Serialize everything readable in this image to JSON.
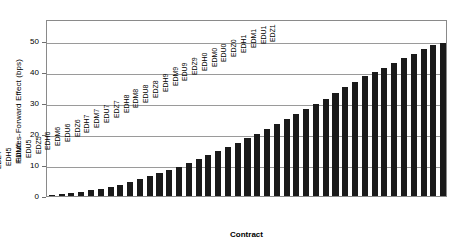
{
  "chart_data": {
    "type": "bar",
    "title": "",
    "xlabel": "Contract",
    "ylabel": "Futures-Forward Effect (bps)",
    "ylim": [
      0,
      57
    ],
    "yticks": [
      0,
      10,
      20,
      30,
      40,
      50
    ],
    "ytick_labels": [
      "0",
      "10",
      "20",
      "30",
      "40",
      "50"
    ],
    "grid": "horizontal",
    "legend": "none",
    "bar_color": "#1a1a1a",
    "categories": [
      "EDZ1",
      "EDH2",
      "EDM2",
      "EDU2",
      "EDZ2",
      "EDH3",
      "EDM3",
      "EDU3",
      "EDZ3",
      "EDH4",
      "EDM4",
      "EDU4",
      "EDZ4",
      "EDH5",
      "EDM5",
      "EDU5",
      "EDZ5",
      "EDH6",
      "EDM6",
      "EDU6",
      "EDZ6",
      "EDH7",
      "EDM7",
      "EDU7",
      "EDZ7",
      "EDH8",
      "EDM8",
      "EDU8",
      "EDZ8",
      "EDH9",
      "EDM9",
      "EDU9",
      "EDZ9",
      "EDH0",
      "EDM0",
      "EDU0",
      "EDZ0",
      "EDH1",
      "EDM1",
      "EDU1",
      "EDZ1"
    ],
    "values": [
      0.4,
      0.7,
      1.0,
      1.4,
      1.9,
      2.4,
      3.0,
      3.7,
      4.5,
      5.4,
      6.3,
      7.3,
      8.3,
      9.4,
      10.6,
      11.8,
      13.1,
      14.4,
      15.8,
      17.2,
      18.6,
      20.1,
      21.6,
      23.1,
      24.7,
      26.3,
      28.0,
      29.7,
      31.4,
      33.2,
      35.0,
      36.8,
      38.6,
      40.0,
      41.2,
      42.8,
      44.4,
      45.8,
      47.2,
      48.6,
      49.4
    ]
  }
}
